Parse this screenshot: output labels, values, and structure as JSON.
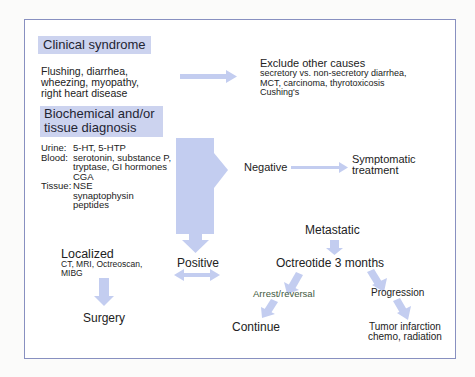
{
  "diagram": {
    "colors": {
      "arrow": "#c3cdf0",
      "header_fill": "#ccd3ef",
      "border": "#8890c0",
      "arrest_text": "#3f5a40"
    },
    "clinical_syndrome": {
      "title": "Clinical syndrome",
      "lines": [
        "Flushing, diarrhea,",
        "wheezing, myopathy,",
        "right heart disease"
      ]
    },
    "exclude": {
      "title": "Exclude other causes",
      "lines": [
        "secretory vs. non-secretory diarrhea,",
        "MCT, carcinoma, thyrotoxicosis",
        "Cushing's"
      ]
    },
    "biochemical": {
      "title_line1": "Biochemical and/or",
      "title_line2": "tissue diagnosis",
      "urine_label": "Urine:",
      "urine_value": "5-HT, 5-HTP",
      "blood_label": "Blood:",
      "blood_lines": [
        "serotonin, substance P,",
        "tryptase, GI hormones",
        "CGA"
      ],
      "tissue_label": "Tissue:",
      "tissue_lines": [
        "NSE",
        "synaptophysin",
        "peptides"
      ]
    },
    "negative": {
      "label": "Negative",
      "result_line1": "Symptomatic",
      "result_line2": "treatment"
    },
    "positive": {
      "label": "Positive"
    },
    "localized": {
      "title": "Localized",
      "lines": [
        "CT, MRI, Octreoscan,",
        "MIBG"
      ],
      "result": "Surgery"
    },
    "metastatic": {
      "title": "Metastatic",
      "treatment": "Octreotide 3 months",
      "arrest": "Arrest/reversal",
      "arrest_result": "Continue",
      "progression": "Progression",
      "progression_lines": [
        "Tumor infarction",
        "chemo, radiation"
      ]
    }
  }
}
